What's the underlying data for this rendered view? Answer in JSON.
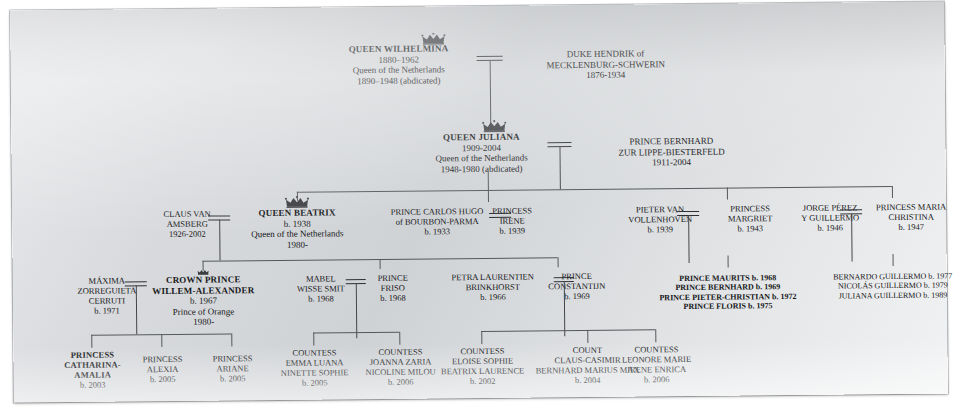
{
  "icons": {
    "crown": "crown-icon"
  },
  "generations": [
    {
      "id": "gen1",
      "people": [
        {
          "id": "wilhelmina",
          "crown": true,
          "lines": [
            {
              "text": "QUEEN WILHELMINA",
              "bold": true
            },
            {
              "text": "1880–1962"
            },
            {
              "text": "Queen of the Netherlands"
            },
            {
              "text": "1890–1948 (abdicated)"
            }
          ]
        },
        {
          "id": "hendrik",
          "crown": false,
          "lines": [
            {
              "text": "DUKE HENDRIK of"
            },
            {
              "text": "MECKLENBURG-SCHWERIN"
            },
            {
              "text": "1876-1934"
            }
          ]
        }
      ]
    },
    {
      "id": "gen2",
      "people": [
        {
          "id": "juliana",
          "crown": true,
          "lines": [
            {
              "text": "QUEEN JULIANA",
              "bold": true
            },
            {
              "text": "1909-2004"
            },
            {
              "text": "Queen of the Netherlands"
            },
            {
              "text": "1948-1980 (abdicated)"
            }
          ]
        },
        {
          "id": "bernhard",
          "crown": false,
          "lines": [
            {
              "text": "PRINCE BERNHARD"
            },
            {
              "text": "ZUR LIPPE-BIESTERFELD"
            },
            {
              "text": "1911-2004"
            }
          ]
        }
      ]
    },
    {
      "id": "gen3",
      "people": [
        {
          "id": "claus",
          "crown": false,
          "lines": [
            {
              "text": "CLAUS VAN"
            },
            {
              "text": "AMSBERG"
            },
            {
              "text": "1926-2002"
            }
          ]
        },
        {
          "id": "beatrix",
          "crown": true,
          "lines": [
            {
              "text": "QUEEN BEATRIX",
              "bold": true
            },
            {
              "text": "b. 1938"
            },
            {
              "text": "Queen of the Netherlands"
            },
            {
              "text": "1980-"
            }
          ]
        },
        {
          "id": "carlos-hugo",
          "crown": false,
          "lines": [
            {
              "text": "PRINCE CARLOS HUGO"
            },
            {
              "text": "of BOURBON-PARMA"
            },
            {
              "text": "b. 1933"
            }
          ]
        },
        {
          "id": "irene",
          "crown": false,
          "lines": [
            {
              "text": "PRINCESS"
            },
            {
              "text": "IRENE"
            },
            {
              "text": "b. 1939"
            }
          ]
        },
        {
          "id": "pieter-van-vollenhoven",
          "crown": false,
          "lines": [
            {
              "text": "PIETER VAN"
            },
            {
              "text": "VOLLENHOVEN"
            },
            {
              "text": "b. 1939"
            }
          ]
        },
        {
          "id": "margriet",
          "crown": false,
          "lines": [
            {
              "text": "PRINCESS"
            },
            {
              "text": "MARGRIET"
            },
            {
              "text": "b. 1943"
            }
          ]
        },
        {
          "id": "jorge-perez-y-guillermo",
          "crown": false,
          "lines": [
            {
              "text": "JORGE PÉREZ"
            },
            {
              "text": "Y GUILLERMO"
            },
            {
              "text": "b. 1946"
            }
          ]
        },
        {
          "id": "maria-christina",
          "crown": false,
          "lines": [
            {
              "text": "PRINCESS  MARIA"
            },
            {
              "text": "CHRISTINA"
            },
            {
              "text": "b. 1947"
            }
          ]
        }
      ]
    },
    {
      "id": "gen4",
      "people": [
        {
          "id": "maxima",
          "crown": false,
          "lines": [
            {
              "text": "MÁXIMA"
            },
            {
              "text": "ZORREGUIETA"
            },
            {
              "text": "CERRUTI"
            },
            {
              "text": "b. 1971"
            }
          ]
        },
        {
          "id": "willem-alexander",
          "crown": true,
          "lines": [
            {
              "text": "CROWN PRINCE",
              "bold": true
            },
            {
              "text": "WILLEM-ALEXANDER",
              "bold": true
            },
            {
              "text": "b. 1967"
            },
            {
              "text": "Prince of Orange"
            },
            {
              "text": "1980-"
            }
          ]
        },
        {
          "id": "mabel",
          "crown": false,
          "lines": [
            {
              "text": "MABEL"
            },
            {
              "text": "WISSE SMIT"
            },
            {
              "text": "b. 1968"
            }
          ]
        },
        {
          "id": "friso",
          "crown": false,
          "lines": [
            {
              "text": "PRINCE"
            },
            {
              "text": "FRISO"
            },
            {
              "text": "b. 1968"
            }
          ]
        },
        {
          "id": "petra-laurentien",
          "crown": false,
          "lines": [
            {
              "text": "PETRA LAURENTIEN"
            },
            {
              "text": "BRINKHORST"
            },
            {
              "text": "b. 1966"
            }
          ]
        },
        {
          "id": "constantijn",
          "crown": false,
          "lines": [
            {
              "text": "PRINCE"
            },
            {
              "text": "CONSTANTIJN"
            },
            {
              "text": "b. 1969"
            }
          ]
        }
      ],
      "lists": [
        {
          "id": "margriet-children",
          "lines": [
            {
              "text": "PRINCE MAURITS b. 1968"
            },
            {
              "text": "PRINCE BERNHARD b. 1969"
            },
            {
              "text": "PRINCE PIETER-CHRISTIAN b. 1972"
            },
            {
              "text": "PRINCE FLORIS b. 1975"
            }
          ]
        },
        {
          "id": "christina-children",
          "lines": [
            {
              "text": "BERNARDO GUILLERMO b. 1977"
            },
            {
              "text": "NICOLÁS GUILLERMO b. 1979"
            },
            {
              "text": "JULIANA GUILLERMO b. 1989"
            }
          ]
        }
      ]
    },
    {
      "id": "gen5",
      "people": [
        {
          "id": "catharina-amalia",
          "crown": false,
          "lines": [
            {
              "text": "PRINCESS",
              "bold": true
            },
            {
              "text": "CATHARINA-",
              "bold": true
            },
            {
              "text": "AMALIA",
              "bold": true
            },
            {
              "text": "b. 2003"
            }
          ]
        },
        {
          "id": "alexia",
          "crown": false,
          "lines": [
            {
              "text": "PRINCESS"
            },
            {
              "text": "ALEXIA"
            },
            {
              "text": "b. 2005"
            }
          ]
        },
        {
          "id": "ariane",
          "crown": false,
          "lines": [
            {
              "text": "PRINCESS"
            },
            {
              "text": "ARIANE"
            },
            {
              "text": "b. 2005"
            }
          ]
        },
        {
          "id": "emma-luana",
          "crown": false,
          "lines": [
            {
              "text": "COUNTESS"
            },
            {
              "text": "EMMA LUANA"
            },
            {
              "text": "NINETTE SOPHIE"
            },
            {
              "text": "b. 2005"
            }
          ]
        },
        {
          "id": "joanna-zaria",
          "crown": false,
          "lines": [
            {
              "text": "COUNTESS"
            },
            {
              "text": "JOANNA ZARIA"
            },
            {
              "text": "NICOLINE MILOU"
            },
            {
              "text": "b. 2006"
            }
          ]
        },
        {
          "id": "eloise-sophie",
          "crown": false,
          "lines": [
            {
              "text": "COUNTESS"
            },
            {
              "text": "ELOISE SOPHIE"
            },
            {
              "text": "BEATRIX LAURENCE"
            },
            {
              "text": "b. 2002"
            }
          ]
        },
        {
          "id": "claus-casimir",
          "crown": false,
          "lines": [
            {
              "text": "COUNT"
            },
            {
              "text": "CLAUS-CASIMIR"
            },
            {
              "text": "BERNHARD MARIUS MAX"
            },
            {
              "text": "b. 2004"
            }
          ]
        },
        {
          "id": "leonore-marie",
          "crown": false,
          "lines": [
            {
              "text": "COUNTESS"
            },
            {
              "text": "LEONORE MARIE"
            },
            {
              "text": "IRENE ENRICA"
            },
            {
              "text": "b. 2006"
            }
          ]
        }
      ]
    }
  ]
}
